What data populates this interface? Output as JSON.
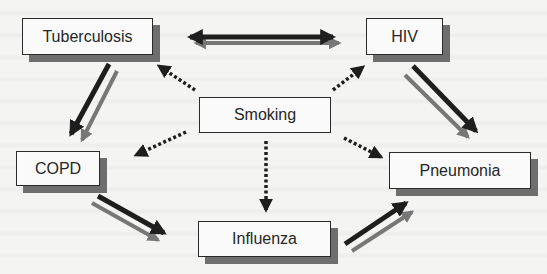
{
  "diagram": {
    "nodes": [
      {
        "id": "tuberculosis",
        "label": "Tuberculosis"
      },
      {
        "id": "hiv",
        "label": "HIV"
      },
      {
        "id": "smoking",
        "label": "Smoking"
      },
      {
        "id": "copd",
        "label": "COPD"
      },
      {
        "id": "pneumonia",
        "label": "Pneumonia"
      },
      {
        "id": "influenza",
        "label": "Influenza"
      }
    ],
    "edges": [
      {
        "from": "tuberculosis",
        "to": "hiv",
        "style": "double-solid",
        "direction": "bidirectional"
      },
      {
        "from": "tuberculosis",
        "to": "copd",
        "style": "double-solid",
        "direction": "forward"
      },
      {
        "from": "hiv",
        "to": "pneumonia",
        "style": "double-solid",
        "direction": "forward"
      },
      {
        "from": "copd",
        "to": "influenza",
        "style": "double-solid",
        "direction": "forward"
      },
      {
        "from": "influenza",
        "to": "pneumonia",
        "style": "double-solid",
        "direction": "forward"
      },
      {
        "from": "smoking",
        "to": "tuberculosis",
        "style": "dotted",
        "direction": "forward"
      },
      {
        "from": "smoking",
        "to": "hiv",
        "style": "dotted",
        "direction": "forward"
      },
      {
        "from": "smoking",
        "to": "copd",
        "style": "dotted",
        "direction": "forward"
      },
      {
        "from": "smoking",
        "to": "pneumonia",
        "style": "dotted",
        "direction": "forward"
      },
      {
        "from": "smoking",
        "to": "influenza",
        "style": "dotted",
        "direction": "forward"
      }
    ],
    "colors": {
      "arrow_dark": "#1e1e1e",
      "arrow_gray": "#777777",
      "box_border": "#2a2a2a",
      "box_shadow": "#6e6e6e",
      "background": "#f4f4f2"
    }
  }
}
